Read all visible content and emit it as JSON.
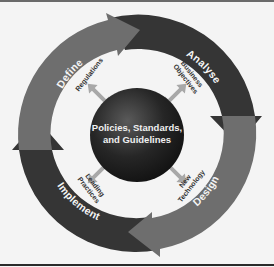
{
  "diagram": {
    "type": "cycle",
    "center": {
      "lines": [
        "Policies, Standards,",
        "and Guidelines"
      ]
    },
    "stages": [
      {
        "label": "Define",
        "position": "top-left",
        "color": "#6e6e6e"
      },
      {
        "label": "Analyse",
        "position": "top-right",
        "color": "#353535"
      },
      {
        "label": "Design",
        "position": "bottom-right",
        "color": "#6e6e6e"
      },
      {
        "label": "Implement",
        "position": "bottom-left",
        "color": "#353535"
      }
    ],
    "spokes": [
      {
        "lines": [
          "Regulations"
        ],
        "position": "top-left"
      },
      {
        "lines": [
          "Business",
          "Objectives"
        ],
        "position": "top-right"
      },
      {
        "lines": [
          "New",
          "Technology"
        ],
        "position": "bottom-right"
      },
      {
        "lines": [
          "Leading",
          "Practices"
        ],
        "position": "bottom-left"
      }
    ],
    "colors": {
      "background": "#f4f4f4",
      "dark_segment": "#353535",
      "light_segment": "#6e6e6e",
      "spoke_arrow": "#a8a8a8",
      "core": "#1e1e1e"
    }
  }
}
